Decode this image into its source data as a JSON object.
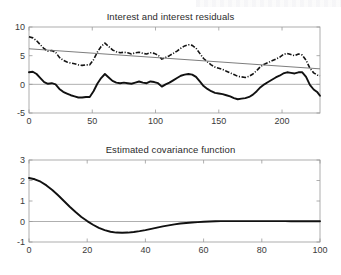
{
  "figure": {
    "background": "#ffffff",
    "line_color": "#111111",
    "trend_color": "#6e6e6e",
    "axis_color": "#9a9a9a"
  },
  "chart_data": [
    {
      "type": "line",
      "id": "interest-and-residuals",
      "title": "Interest and interest residuals",
      "xlabel": "",
      "ylabel": "",
      "xlim": [
        0,
        230
      ],
      "ylim": [
        -5,
        10
      ],
      "xticks": [
        0,
        50,
        100,
        150,
        200
      ],
      "yticks": [
        -5,
        0,
        5,
        10
      ],
      "grid": false,
      "legend": "none",
      "zero_reference_line": 0,
      "series": [
        {
          "name": "interest rate",
          "style": "dash-dot",
          "color": "#141414",
          "x": [
            0,
            3,
            6,
            9,
            12,
            15,
            18,
            21,
            24,
            27,
            30,
            33,
            36,
            39,
            42,
            45,
            48,
            51,
            54,
            57,
            60,
            63,
            66,
            69,
            72,
            75,
            78,
            81,
            84,
            87,
            90,
            93,
            96,
            99,
            102,
            105,
            108,
            111,
            114,
            117,
            120,
            123,
            126,
            129,
            132,
            135,
            138,
            141,
            144,
            147,
            150,
            153,
            156,
            159,
            162,
            165,
            168,
            171,
            174,
            177,
            180,
            183,
            186,
            189,
            192,
            195,
            198,
            201,
            204,
            207,
            210,
            213,
            216,
            219,
            222,
            225,
            228,
            230
          ],
          "values": [
            8.3,
            8.1,
            7.6,
            6.9,
            6.2,
            5.8,
            5.9,
            5.6,
            4.7,
            4.2,
            3.9,
            3.7,
            3.6,
            3.4,
            3.3,
            3.4,
            3.4,
            4.3,
            5.6,
            6.6,
            7.2,
            6.6,
            6.0,
            5.7,
            5.5,
            5.6,
            5.5,
            5.3,
            5.5,
            5.6,
            5.4,
            5.3,
            5.5,
            5.4,
            5.1,
            4.4,
            4.7,
            5.0,
            5.4,
            5.8,
            6.3,
            6.7,
            6.9,
            6.8,
            6.3,
            5.4,
            4.5,
            3.9,
            3.4,
            3.0,
            2.8,
            2.6,
            2.3,
            2.0,
            1.7,
            1.4,
            1.3,
            1.2,
            1.4,
            1.8,
            2.4,
            3.1,
            3.5,
            3.8,
            4.1,
            4.4,
            4.7,
            5.2,
            5.4,
            5.2,
            5.0,
            5.3,
            5.1,
            4.2,
            2.8,
            2.0,
            1.6,
            1.5
          ]
        },
        {
          "name": "linear trend",
          "style": "solid-thin",
          "color": "#6e6e6e",
          "x": [
            0,
            230
          ],
          "values": [
            6.2,
            2.7
          ]
        },
        {
          "name": "interest residuals",
          "style": "solid-thick",
          "color": "#111111",
          "x": [
            0,
            3,
            6,
            9,
            12,
            15,
            18,
            21,
            24,
            27,
            30,
            33,
            36,
            39,
            42,
            45,
            48,
            51,
            54,
            57,
            60,
            63,
            66,
            69,
            72,
            75,
            78,
            81,
            84,
            87,
            90,
            93,
            96,
            99,
            102,
            105,
            108,
            111,
            114,
            117,
            120,
            123,
            126,
            129,
            132,
            135,
            138,
            141,
            144,
            147,
            150,
            153,
            156,
            159,
            162,
            165,
            168,
            171,
            174,
            177,
            180,
            183,
            186,
            189,
            192,
            195,
            198,
            201,
            204,
            207,
            210,
            213,
            216,
            219,
            222,
            225,
            228,
            230
          ],
          "values": [
            2.1,
            2.2,
            1.8,
            1.1,
            0.4,
            0.1,
            0.2,
            0.0,
            -0.8,
            -1.3,
            -1.6,
            -1.9,
            -2.1,
            -2.3,
            -2.3,
            -2.2,
            -2.2,
            -1.2,
            0.1,
            1.1,
            1.8,
            1.2,
            0.6,
            0.3,
            0.2,
            0.3,
            0.2,
            0.1,
            0.3,
            0.5,
            0.3,
            0.2,
            0.5,
            0.4,
            0.2,
            -0.4,
            0.0,
            0.3,
            0.7,
            1.1,
            1.5,
            1.7,
            1.8,
            1.7,
            1.3,
            0.5,
            -0.3,
            -0.8,
            -1.2,
            -1.5,
            -1.6,
            -1.7,
            -1.9,
            -2.1,
            -2.4,
            -2.6,
            -2.5,
            -2.4,
            -2.2,
            -1.8,
            -1.2,
            -0.5,
            0.0,
            0.4,
            0.8,
            1.2,
            1.5,
            1.9,
            2.1,
            2.0,
            1.9,
            2.1,
            2.1,
            1.3,
            -0.1,
            -0.9,
            -1.4,
            -2.0
          ]
        }
      ]
    },
    {
      "type": "line",
      "id": "estimated-covariance-function",
      "title": "Estimated covariance function",
      "xlabel": "",
      "ylabel": "",
      "xlim": [
        0,
        100
      ],
      "ylim": [
        -1,
        3
      ],
      "xticks": [
        0,
        20,
        40,
        60,
        80,
        100
      ],
      "yticks": [
        -1,
        0,
        1,
        2,
        3
      ],
      "grid": false,
      "legend": "none",
      "zero_reference_line": 0,
      "series": [
        {
          "name": "covariance",
          "style": "solid-thick",
          "color": "#111111",
          "x": [
            0,
            2,
            4,
            6,
            8,
            10,
            12,
            14,
            16,
            18,
            20,
            22,
            24,
            26,
            28,
            30,
            32,
            34,
            36,
            38,
            40,
            42,
            44,
            46,
            48,
            50,
            52,
            54,
            56,
            58,
            60,
            62,
            64,
            66,
            68,
            70,
            72,
            74,
            76,
            78,
            80,
            82,
            84,
            86,
            88,
            90,
            92,
            94,
            96,
            98,
            100
          ],
          "values": [
            2.12,
            2.06,
            1.94,
            1.76,
            1.54,
            1.28,
            1.0,
            0.72,
            0.46,
            0.22,
            0.02,
            -0.16,
            -0.31,
            -0.42,
            -0.5,
            -0.54,
            -0.55,
            -0.54,
            -0.51,
            -0.47,
            -0.42,
            -0.36,
            -0.3,
            -0.24,
            -0.19,
            -0.14,
            -0.1,
            -0.07,
            -0.05,
            -0.03,
            -0.01,
            0.0,
            0.01,
            0.02,
            0.02,
            0.02,
            0.02,
            0.02,
            0.02,
            0.02,
            0.02,
            0.02,
            0.02,
            0.02,
            0.02,
            0.01,
            0.01,
            0.01,
            0.01,
            0.01,
            0.01
          ]
        }
      ]
    }
  ]
}
